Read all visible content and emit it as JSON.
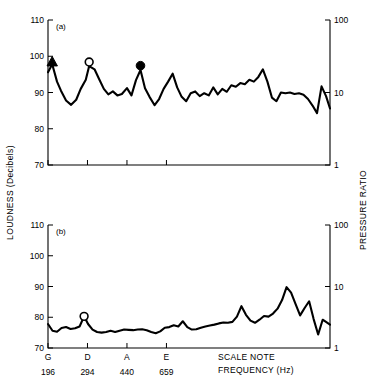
{
  "figure": {
    "left_axis_title": "LOUDNESS (Decibels)",
    "right_axis_title": "PRESSURE RATIO",
    "x_caption_line1": "SCALE NOTE",
    "x_caption_line2": "FREQUENCY  (Hz)",
    "panel_a_label": "(a)",
    "panel_b_label": "(b)"
  },
  "chart_data": {
    "type": "line",
    "title": "",
    "xlabel": "SCALE NOTE FREQUENCY (Hz)",
    "ylabel": "LOUDNESS (Decibels)",
    "ylabel_right": "PRESSURE RATIO",
    "ylim": [
      70,
      110
    ],
    "ylim_right": [
      1,
      100
    ],
    "yscale_right": "log",
    "grid": false,
    "legend": "none",
    "y_ticks": [
      70,
      80,
      90,
      100,
      110
    ],
    "y_ticks_right": [
      1,
      10,
      100
    ],
    "x_tick_notes": [
      "G",
      "D",
      "A",
      "E"
    ],
    "x_tick_frequencies": [
      196,
      294,
      440,
      659
    ],
    "x_tick_positions": [
      0,
      14,
      28,
      42
    ],
    "x_range": [
      0,
      100
    ],
    "panels": [
      {
        "id": "a",
        "label": "(a)",
        "series": [
          {
            "name": "loudness-a",
            "x": [
              0.0,
              1.5,
              3.2,
              4.6,
              6.4,
              8.2,
              10.0,
              11.6,
              13.4,
              14.6,
              16.5,
              18.2,
              19.8,
              21.4,
              23.0,
              24.6,
              26.2,
              28.0,
              29.6,
              31.2,
              32.8,
              34.4,
              36.0,
              37.8,
              39.4,
              41.0,
              42.6,
              44.2,
              45.8,
              47.4,
              49.0,
              50.6,
              52.2,
              53.8,
              55.4,
              57.0,
              58.6,
              60.2,
              61.8,
              63.4,
              65.0,
              66.6,
              68.2,
              69.8,
              71.4,
              73.0,
              74.6,
              76.2,
              77.8,
              79.4,
              81.0,
              82.6,
              84.2,
              85.8,
              87.4,
              89.0,
              90.6,
              92.2,
              93.8,
              95.4,
              97.0,
              98.6,
              100.0
            ],
            "y": [
              95.6,
              97.8,
              93.0,
              90.5,
              87.8,
              86.6,
              88.0,
              91.0,
              93.5,
              97.3,
              96.4,
              93.6,
              91.0,
              89.5,
              90.3,
              89.2,
              89.6,
              91.2,
              89.2,
              93.4,
              96.2,
              91.2,
              88.8,
              86.5,
              88.2,
              91.0,
              93.0,
              95.2,
              91.4,
              88.8,
              87.6,
              89.8,
              90.3,
              89.0,
              89.8,
              89.2,
              91.4,
              89.5,
              91.0,
              90.2,
              92.0,
              91.6,
              92.6,
              92.3,
              93.5,
              93.0,
              94.3,
              96.4,
              93.0,
              88.6,
              87.6,
              90.0,
              89.8,
              90.0,
              89.6,
              89.8,
              89.4,
              88.2,
              86.4,
              84.3,
              91.7,
              89.0,
              85.6
            ]
          }
        ],
        "markers": [
          {
            "shape": "triangle-filled",
            "x": 1.5,
            "y": 98.5,
            "note": "G"
          },
          {
            "shape": "circle-open",
            "x": 14.6,
            "y": 98.4,
            "note": "D"
          },
          {
            "shape": "circle-filled",
            "x": 32.8,
            "y": 97.4,
            "note": "A"
          }
        ]
      },
      {
        "id": "b",
        "label": "(b)",
        "series": [
          {
            "name": "loudness-b",
            "x": [
              0.0,
              1.6,
              3.2,
              4.8,
              6.4,
              8.0,
              9.6,
              11.2,
              12.8,
              14.2,
              15.8,
              17.4,
              19.0,
              20.6,
              22.2,
              23.8,
              25.4,
              27.0,
              28.6,
              30.2,
              31.8,
              33.4,
              35.0,
              36.6,
              38.2,
              39.8,
              41.4,
              43.0,
              44.6,
              46.2,
              47.8,
              49.4,
              51.0,
              52.6,
              54.2,
              55.8,
              57.4,
              59.0,
              60.6,
              62.2,
              63.8,
              65.4,
              67.0,
              68.6,
              70.2,
              71.8,
              73.4,
              75.0,
              76.6,
              78.2,
              79.8,
              81.4,
              83.0,
              84.6,
              86.2,
              87.8,
              89.4,
              91.0,
              92.6,
              94.2,
              95.8,
              97.4,
              100.0
            ],
            "y": [
              77.8,
              75.6,
              75.3,
              76.5,
              76.8,
              76.2,
              76.4,
              77.0,
              80.3,
              77.8,
              76.0,
              75.2,
              75.0,
              75.2,
              75.6,
              75.2,
              75.6,
              76.0,
              75.9,
              75.8,
              76.0,
              76.1,
              75.8,
              75.2,
              74.8,
              75.4,
              76.6,
              76.8,
              77.4,
              77.0,
              78.7,
              76.8,
              76.0,
              76.1,
              76.6,
              77.0,
              77.3,
              77.6,
              78.0,
              78.3,
              78.2,
              78.5,
              80.2,
              83.6,
              80.8,
              78.9,
              78.2,
              79.2,
              80.4,
              80.2,
              81.2,
              82.8,
              85.6,
              89.8,
              88.0,
              84.3,
              80.6,
              83.0,
              85.2,
              79.4,
              74.4,
              79.2,
              77.6
            ]
          }
        ],
        "markers": [
          {
            "shape": "circle-open",
            "x": 12.8,
            "y": 80.3,
            "note": "D"
          }
        ]
      }
    ]
  }
}
